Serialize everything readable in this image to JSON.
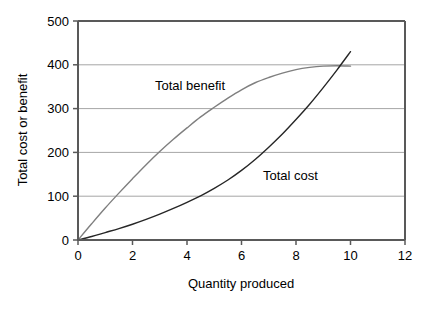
{
  "chart_data": {
    "type": "line",
    "title": "",
    "xlabel": "Quantity produced",
    "ylabel": "Total cost or benefit",
    "xlim": [
      0,
      12
    ],
    "ylim": [
      0,
      500
    ],
    "xticks": [
      "0",
      "2",
      "4",
      "6",
      "8",
      "10",
      "12"
    ],
    "yticks": [
      "0",
      "100",
      "200",
      "300",
      "400",
      "500"
    ],
    "grid": "horizontal",
    "legend_position": "inline-annotations",
    "annotations": [
      {
        "text": "Total benefit",
        "x": 3.0,
        "y": 350
      },
      {
        "text": "Total cost",
        "x": 7.4,
        "y": 160
      }
    ],
    "series": [
      {
        "name": "Total benefit",
        "color": "#7f7f7f",
        "x": [
          0,
          0.5,
          1,
          1.5,
          2,
          2.5,
          3,
          3.5,
          4,
          4.5,
          5,
          5.5,
          6,
          6.5,
          7,
          7.5,
          8,
          8.5,
          9,
          9.5,
          10
        ],
        "values": [
          0,
          37,
          73,
          107,
          140,
          172,
          202,
          230,
          256,
          281,
          303,
          324,
          343,
          359,
          371,
          381,
          389,
          394,
          397,
          398,
          397
        ]
      },
      {
        "name": "Total cost",
        "color": "#262626",
        "x": [
          0,
          0.5,
          1,
          1.5,
          2,
          2.5,
          3,
          3.5,
          4,
          4.5,
          5,
          5.5,
          6,
          6.5,
          7,
          7.5,
          8,
          8.5,
          9,
          9.5,
          10
        ],
        "values": [
          0,
          8,
          17,
          26,
          36,
          47,
          59,
          72,
          86,
          101,
          118,
          137,
          159,
          184,
          212,
          242,
          275,
          310,
          348,
          388,
          430
        ]
      }
    ]
  },
  "axes": {
    "x_axis_label": "Quantity produced",
    "y_axis_label": "Total cost or benefit"
  }
}
